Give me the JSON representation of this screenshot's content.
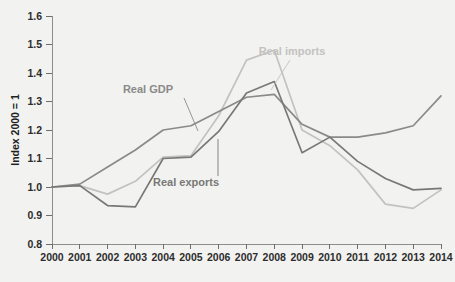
{
  "chart_data": {
    "type": "line",
    "title": "",
    "subtitle": "",
    "xlabel": "",
    "ylabel": "Index 2000 = 1",
    "x": [
      2000,
      2001,
      2002,
      2003,
      2004,
      2005,
      2006,
      2007,
      2008,
      2009,
      2010,
      2011,
      2012,
      2013,
      2014
    ],
    "categories": [
      "2000",
      "2001",
      "2002",
      "2003",
      "2004",
      "2005",
      "2006",
      "2007",
      "2008",
      "2009",
      "2010",
      "2011",
      "2012",
      "2013",
      "2014"
    ],
    "xlim": [
      2000,
      2014
    ],
    "ylim": [
      0.8,
      1.6
    ],
    "yticks": [
      0.8,
      0.9,
      1.0,
      1.1,
      1.2,
      1.3,
      1.4,
      1.5,
      1.6
    ],
    "ytick_labels": [
      "0.8",
      "0.9",
      "1.0",
      "1.1",
      "1.2",
      "1.3",
      "1.4",
      "1.5",
      "1.6"
    ],
    "grid": false,
    "legend_position": "inline-annotations",
    "series": [
      {
        "name": "Real GDP",
        "color": "#8a8a88",
        "values": [
          1.0,
          1.01,
          1.07,
          1.13,
          1.2,
          1.215,
          1.265,
          1.315,
          1.325,
          1.22,
          1.175,
          1.175,
          1.19,
          1.215,
          1.32
        ]
      },
      {
        "name": "Real exports",
        "color": "#787876",
        "values": [
          1.0,
          1.005,
          0.935,
          0.93,
          1.1,
          1.105,
          1.195,
          1.33,
          1.37,
          1.12,
          1.175,
          1.09,
          1.03,
          0.99,
          0.995
        ]
      },
      {
        "name": "Real imports",
        "color": "#c2c2c0",
        "values": [
          1.0,
          1.005,
          0.975,
          1.02,
          1.105,
          1.11,
          1.25,
          1.445,
          1.48,
          1.2,
          1.145,
          1.06,
          0.94,
          0.925,
          0.99
        ]
      }
    ],
    "annotations": [
      {
        "text": "Real GDP",
        "series": "Real GDP",
        "color": "#8a8a88",
        "label_x": 148,
        "label_y": 93,
        "leader_from_x": 184,
        "leader_from_y": 98,
        "leader_to_x": 198,
        "leader_to_y": 131
      },
      {
        "text": "Real exports",
        "series": "Real exports",
        "color": "#787876",
        "label_x": 186,
        "label_y": 186,
        "leader_from_x": 218,
        "leader_from_y": 176,
        "leader_to_x": 218,
        "leader_to_y": 139
      },
      {
        "text": "Real imports",
        "series": "Real imports",
        "color": "#c2c2c0",
        "label_x": 292,
        "label_y": 55,
        "leader_from_x": 290,
        "leader_from_y": 60,
        "leader_to_x": 271,
        "leader_to_y": 90
      }
    ]
  },
  "plot": {
    "background": "#f2f2f0",
    "axis_color": "#8e8e8c",
    "tick_color": "#6e6e6c",
    "text_color": "#2d2d2d",
    "left": 52,
    "right": 441,
    "top": 16,
    "bottom": 244
  }
}
